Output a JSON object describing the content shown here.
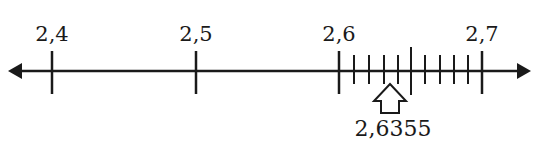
{
  "number_line": {
    "axis_color": "#1a1a1a",
    "major_ticks": [
      {
        "value": "2,4",
        "x": 52
      },
      {
        "value": "2,5",
        "x": 196
      },
      {
        "value": "2,6",
        "x": 339
      },
      {
        "value": "2,7",
        "x": 482
      }
    ],
    "minor_ticks_between_2_6_and_2_7": [
      354,
      369,
      384,
      398,
      425,
      440,
      454,
      468
    ],
    "midpoint_tick_x": 411,
    "marker": {
      "label": "2,6355",
      "x": 390
    }
  }
}
